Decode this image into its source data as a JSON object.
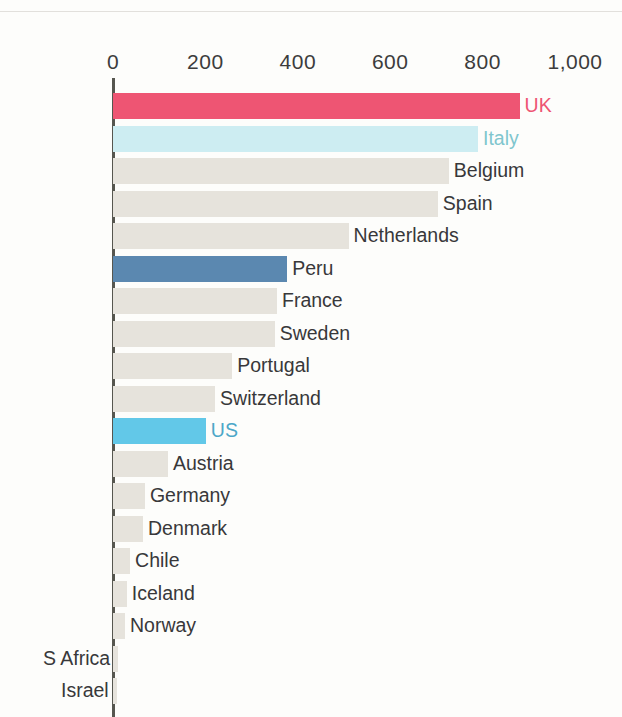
{
  "chart_data": {
    "type": "bar",
    "orientation": "horizontal",
    "title": "",
    "subtitle": "",
    "xlabel": "",
    "ylabel": "",
    "xlim": [
      0,
      1000
    ],
    "grid": false,
    "legend": "none",
    "axis_ticks": [
      {
        "label": "0",
        "value": 0
      },
      {
        "label": "200",
        "value": 200
      },
      {
        "label": "400",
        "value": 400
      },
      {
        "label": "600",
        "value": 600
      },
      {
        "label": "800",
        "value": 800
      },
      {
        "label": "1,000",
        "value": 1000
      }
    ],
    "categories": [
      "UK",
      "Italy",
      "Belgium",
      "Spain",
      "Netherlands",
      "Peru",
      "France",
      "Sweden",
      "Portugal",
      "Switzerland",
      "US",
      "Austria",
      "Germany",
      "Denmark",
      "Chile",
      "Iceland",
      "Norway",
      "S Africa",
      "Israel"
    ],
    "values": [
      880,
      790,
      727,
      703,
      510,
      377,
      355,
      350,
      258,
      221,
      201,
      119,
      69,
      65,
      37,
      30,
      26,
      11,
      8
    ],
    "bars": [
      {
        "label": "UK",
        "value": 880,
        "color": "#ee5573",
        "label_color": "#ee5573",
        "label_side": "right",
        "highlight": true
      },
      {
        "label": "Italy",
        "value": 790,
        "color": "#cdedf2",
        "label_color": "#7fc6ce",
        "label_side": "right",
        "highlight": true
      },
      {
        "label": "Belgium",
        "value": 727,
        "color": "#e6e3dc",
        "label_color": "#38383a",
        "label_side": "right",
        "highlight": false
      },
      {
        "label": "Spain",
        "value": 703,
        "color": "#e6e3dc",
        "label_color": "#38383a",
        "label_side": "right",
        "highlight": false
      },
      {
        "label": "Netherlands",
        "value": 510,
        "color": "#e6e3dc",
        "label_color": "#38383a",
        "label_side": "right",
        "highlight": false
      },
      {
        "label": "Peru",
        "value": 377,
        "color": "#5b88b0",
        "label_color": "#38383a",
        "label_side": "right",
        "highlight": true
      },
      {
        "label": "France",
        "value": 355,
        "color": "#e6e3dc",
        "label_color": "#38383a",
        "label_side": "right",
        "highlight": false
      },
      {
        "label": "Sweden",
        "value": 350,
        "color": "#e6e3dc",
        "label_color": "#38383a",
        "label_side": "right",
        "highlight": false
      },
      {
        "label": "Portugal",
        "value": 258,
        "color": "#e6e3dc",
        "label_color": "#38383a",
        "label_side": "right",
        "highlight": false
      },
      {
        "label": "Switzerland",
        "value": 221,
        "color": "#e6e3dc",
        "label_color": "#38383a",
        "label_side": "right",
        "highlight": false
      },
      {
        "label": "US",
        "value": 201,
        "color": "#62c8e8",
        "label_color": "#4ca7c8",
        "label_side": "right",
        "highlight": true
      },
      {
        "label": "Austria",
        "value": 119,
        "color": "#e6e3dc",
        "label_color": "#38383a",
        "label_side": "right",
        "highlight": false
      },
      {
        "label": "Germany",
        "value": 69,
        "color": "#e6e3dc",
        "label_color": "#38383a",
        "label_side": "right",
        "highlight": false
      },
      {
        "label": "Denmark",
        "value": 65,
        "color": "#e6e3dc",
        "label_color": "#38383a",
        "label_side": "right",
        "highlight": false
      },
      {
        "label": "Chile",
        "value": 37,
        "color": "#e6e3dc",
        "label_color": "#38383a",
        "label_side": "right",
        "highlight": false
      },
      {
        "label": "Iceland",
        "value": 30,
        "color": "#e6e3dc",
        "label_color": "#38383a",
        "label_side": "right",
        "highlight": false
      },
      {
        "label": "Norway",
        "value": 26,
        "color": "#e6e3dc",
        "label_color": "#38383a",
        "label_side": "right",
        "highlight": false
      },
      {
        "label": "S Africa",
        "value": 11,
        "color": "#e6e3dc",
        "label_color": "#38383a",
        "label_side": "left",
        "highlight": false
      },
      {
        "label": "Israel",
        "value": 8,
        "color": "#e6e3dc",
        "label_color": "#38383a",
        "label_side": "left",
        "highlight": false
      }
    ],
    "colors": {
      "default_bar": "#e6e3dc",
      "uk": "#ee5573",
      "italy": "#cdedf2",
      "peru": "#5b88b0",
      "us": "#62c8e8",
      "axis": "#56564f",
      "text": "#38383a",
      "background": "#fdfdfb"
    }
  }
}
